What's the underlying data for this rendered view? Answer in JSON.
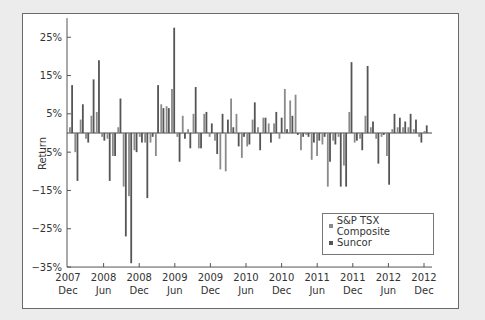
{
  "chart_data": {
    "type": "bar",
    "title": "",
    "xlabel": "",
    "ylabel": "Return",
    "ylim": [
      -35,
      30
    ],
    "yticks": [
      "25%",
      "15%",
      "5%",
      "-5%",
      "-15%",
      "-25%",
      "-35%"
    ],
    "ytick_values": [
      25,
      15,
      5,
      -5,
      -15,
      -25,
      -35
    ],
    "xtick_labels": [
      {
        "year": "2007",
        "month": "Dec"
      },
      {
        "year": "2008",
        "month": "Jun"
      },
      {
        "year": "2008",
        "month": "Dec"
      },
      {
        "year": "2009",
        "month": "Jun"
      },
      {
        "year": "2009",
        "month": "Dec"
      },
      {
        "year": "2010",
        "month": "Jun"
      },
      {
        "year": "2010",
        "month": "Dec"
      },
      {
        "year": "2011",
        "month": "Jun"
      },
      {
        "year": "2011",
        "month": "Dec"
      },
      {
        "year": "2012",
        "month": "Jun"
      },
      {
        "year": "2012",
        "month": "Dec"
      }
    ],
    "grid": false,
    "legend_position": "lower right",
    "series": [
      {
        "name": "S&P TSX Composite",
        "color": "#8a8a8a",
        "values": [
          1.5,
          -5,
          3.5,
          -1.5,
          4.5,
          5.5,
          -1,
          -1.5,
          -6,
          1.5,
          -14,
          -16.5,
          -4.5,
          -1,
          -2.5,
          -2.5,
          -6,
          7.5,
          7,
          11.5,
          -1,
          4.5,
          1,
          5,
          -4,
          5,
          -1,
          -2,
          -9.5,
          -10,
          9,
          5,
          -6.5,
          -3.5,
          3.5,
          1.5,
          4,
          2.5,
          2.5,
          -1.5,
          11.5,
          8.5,
          10,
          -4.5,
          -0.5,
          -7,
          -6,
          -3,
          -14,
          -2,
          -1,
          -8.5,
          5.5,
          -2.5,
          -1.5,
          4.5,
          1.5,
          -1.5,
          -1,
          -6,
          1,
          1.5,
          1.5,
          1.5,
          1,
          -1,
          0.5
        ]
      },
      {
        "name": "Suncor",
        "color": "#555555",
        "values": [
          12.5,
          -12.5,
          7.5,
          -2.5,
          14,
          19,
          -2,
          -12.5,
          -6,
          9,
          -27,
          -34,
          -5,
          -2.5,
          -17,
          -1,
          12.5,
          6.5,
          6.5,
          27.5,
          -7.5,
          -1.5,
          -4,
          12,
          -4,
          5.5,
          2.5,
          -5.5,
          5,
          3.5,
          1.5,
          -3.5,
          -1,
          -3,
          8,
          -4.5,
          4,
          -2.5,
          5.5,
          4,
          1,
          4.5,
          -0.5,
          -1,
          -1,
          -2.5,
          -2,
          -1,
          -7.5,
          -3,
          -14,
          -14,
          18.5,
          -2,
          -4.5,
          17.5,
          3,
          -8,
          -0.5,
          -13.5,
          5,
          4,
          3,
          5,
          3.5,
          -2.5,
          2
        ]
      }
    ]
  },
  "legend": {
    "items": [
      {
        "label": "S&P TSX Composite"
      },
      {
        "label": "Suncor"
      }
    ]
  }
}
